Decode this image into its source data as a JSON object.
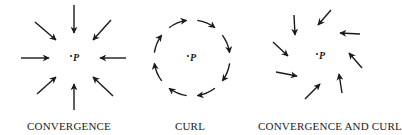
{
  "panels": [
    {
      "id": "convergence",
      "label": "CONVERGENCE",
      "point_label": "P",
      "center": [
        75,
        58
      ],
      "label_x": 69,
      "arrows": [
        [
          74,
          5,
          74,
          33
        ],
        [
          35,
          22,
          56,
          40
        ],
        [
          111,
          20,
          93,
          40
        ],
        [
          21,
          58,
          49,
          58
        ],
        [
          126,
          58,
          100,
          58
        ],
        [
          37,
          94,
          56,
          77
        ],
        [
          74,
          110,
          74,
          84
        ],
        [
          113,
          96,
          93,
          77
        ]
      ]
    },
    {
      "id": "curl",
      "label": "CURL",
      "point_label": "P",
      "center": [
        192,
        58
      ],
      "radius": 38,
      "label_x": 190
    },
    {
      "id": "convergence-and-curl",
      "label": "CONVERGENCE AND CURL",
      "point_label": "P",
      "center": [
        321,
        56
      ],
      "label_x": 330,
      "arrows": [
        [
          294,
          15,
          295,
          35
        ],
        [
          331,
          10,
          318,
          25
        ],
        [
          360,
          34,
          340,
          33
        ],
        [
          273,
          42,
          288,
          56
        ],
        [
          362,
          68,
          349,
          53
        ],
        [
          276,
          72,
          297,
          76
        ],
        [
          305,
          99,
          320,
          84
        ],
        [
          342,
          93,
          339,
          74
        ]
      ]
    }
  ],
  "stroke_color": "#1a1a1a"
}
